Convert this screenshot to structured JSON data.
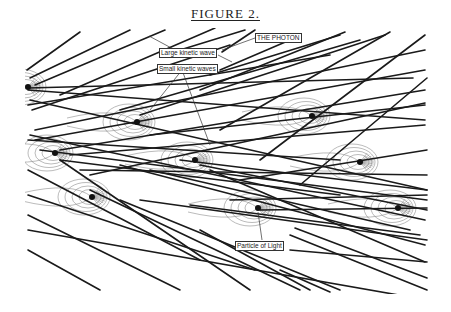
{
  "figure": {
    "title": "FIGURE 2.",
    "labels": {
      "photon": "THE PHOTON",
      "large_wave": "Large kinetic wave",
      "small_waves": "Small kinetic waves",
      "particle": "Particle of Light"
    },
    "colors": {
      "line": "#1a1a1a",
      "contour": "#777777",
      "label_border": "#333333"
    },
    "particles": [
      {
        "x": 28,
        "y": 87
      },
      {
        "x": 137,
        "y": 122
      },
      {
        "x": 312,
        "y": 116
      },
      {
        "x": 55,
        "y": 153
      },
      {
        "x": 195,
        "y": 160
      },
      {
        "x": 360,
        "y": 162
      },
      {
        "x": 92,
        "y": 197
      },
      {
        "x": 258,
        "y": 208
      },
      {
        "x": 398,
        "y": 208
      }
    ],
    "lines": [
      [
        27,
        70,
        80,
        32
      ],
      [
        30,
        78,
        130,
        30
      ],
      [
        35,
        85,
        165,
        30
      ],
      [
        60,
        95,
        215,
        28
      ],
      [
        32,
        110,
        230,
        45
      ],
      [
        180,
        50,
        245,
        30
      ],
      [
        222,
        52,
        255,
        30
      ],
      [
        220,
        70,
        290,
        40
      ],
      [
        210,
        75,
        340,
        35
      ],
      [
        200,
        90,
        345,
        32
      ],
      [
        120,
        110,
        360,
        40
      ],
      [
        140,
        115,
        385,
        35
      ],
      [
        220,
        130,
        390,
        32
      ],
      [
        260,
        160,
        425,
        35
      ],
      [
        300,
        185,
        427,
        78
      ],
      [
        28,
        88,
        413,
        78
      ],
      [
        28,
        90,
        425,
        120
      ],
      [
        28,
        105,
        330,
        55
      ],
      [
        35,
        130,
        425,
        50
      ],
      [
        35,
        140,
        425,
        70
      ],
      [
        60,
        150,
        425,
        90
      ],
      [
        90,
        175,
        425,
        103
      ],
      [
        70,
        155,
        425,
        125
      ],
      [
        28,
        140,
        340,
        160
      ],
      [
        150,
        135,
        425,
        105
      ],
      [
        30,
        100,
        427,
        190
      ],
      [
        30,
        135,
        425,
        220
      ],
      [
        40,
        150,
        427,
        200
      ],
      [
        60,
        160,
        340,
        195
      ],
      [
        80,
        170,
        427,
        175
      ],
      [
        120,
        165,
        425,
        245
      ],
      [
        150,
        170,
        410,
        230
      ],
      [
        180,
        160,
        427,
        190
      ],
      [
        200,
        165,
        427,
        210
      ],
      [
        210,
        170,
        425,
        262
      ],
      [
        28,
        170,
        200,
        260
      ],
      [
        28,
        195,
        255,
        270
      ],
      [
        28,
        230,
        427,
        300
      ],
      [
        28,
        250,
        100,
        290
      ],
      [
        28,
        215,
        180,
        290
      ],
      [
        60,
        160,
        250,
        290
      ],
      [
        90,
        190,
        300,
        290
      ],
      [
        120,
        200,
        340,
        290
      ],
      [
        200,
        230,
        310,
        290
      ],
      [
        280,
        270,
        330,
        292
      ],
      [
        290,
        235,
        427,
        290
      ],
      [
        295,
        228,
        427,
        278
      ],
      [
        290,
        250,
        427,
        262
      ],
      [
        140,
        200,
        427,
        240
      ],
      [
        190,
        205,
        420,
        235
      ],
      [
        240,
        180,
        427,
        150
      ],
      [
        230,
        200,
        427,
        195
      ],
      [
        260,
        210,
        427,
        208
      ]
    ],
    "pointers": [
      [
        149,
        36,
        190,
        58
      ],
      [
        182,
        70,
        150,
        110
      ],
      [
        182,
        70,
        210,
        145
      ],
      [
        218,
        55,
        232,
        62
      ],
      [
        255,
        38,
        222,
        50
      ],
      [
        258,
        212,
        262,
        240
      ]
    ]
  }
}
